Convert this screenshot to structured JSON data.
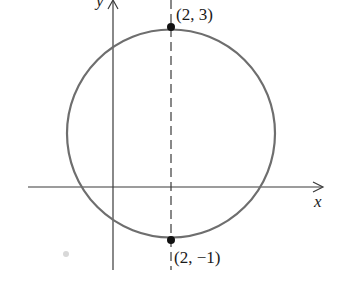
{
  "diagram": {
    "type": "circle-on-coordinate-plane",
    "axes": {
      "x_label": "x",
      "y_label": "y"
    },
    "circle": {
      "stroke_color": "#6e6e6e"
    },
    "dashed_line": {
      "description": "vertical diameter at x = 2"
    },
    "points": [
      {
        "label": "(2, 3)"
      },
      {
        "label": "(2, −1)"
      }
    ],
    "colors": {
      "axis": "#3a3a3a",
      "point": "#111111",
      "text": "#1a1a1a"
    }
  }
}
